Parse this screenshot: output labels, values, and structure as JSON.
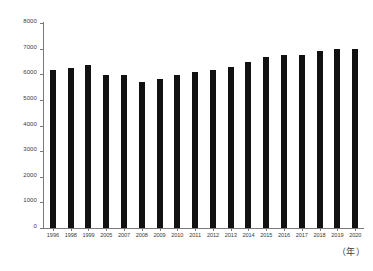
{
  "chart_data": {
    "type": "bar",
    "title": "",
    "subtitle": "",
    "xlabel": "（年）",
    "ylabel": "",
    "ylim": [
      0,
      8000
    ],
    "ytick_step": 1000,
    "yticks": [
      "8000",
      "7000",
      "6000",
      "5000",
      "4000",
      "3000",
      "2000",
      "1000",
      "0"
    ],
    "grid": false,
    "legend": false,
    "legend_position": "none",
    "bar_color": "#111111",
    "axis_color": "#7a7a7a",
    "categories": [
      "1996",
      "1998",
      "1999",
      "2005",
      "2007",
      "2008",
      "2009",
      "2010",
      "2011",
      "2012",
      "2013",
      "2014",
      "2015",
      "2016",
      "2017",
      "2018",
      "2019",
      "2020"
    ],
    "values": [
      6180,
      6250,
      6380,
      5990,
      5990,
      5680,
      5800,
      5980,
      6090,
      6180,
      6300,
      6480,
      6680,
      6760,
      6770,
      6890,
      6980,
      6990
    ],
    "series": [
      {
        "name": "",
        "values": [
          6180,
          6250,
          6380,
          5990,
          5990,
          5680,
          5800,
          5980,
          6090,
          6180,
          6300,
          6480,
          6680,
          6760,
          6770,
          6890,
          6980,
          6990
        ]
      }
    ]
  }
}
